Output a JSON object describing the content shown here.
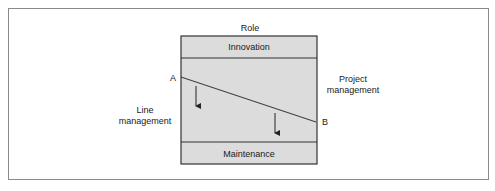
{
  "diagram": {
    "title": "Role",
    "top_band": "Innovation",
    "bottom_band": "Maintenance",
    "left_label": [
      "Line",
      "management"
    ],
    "right_label": [
      "Project",
      "management"
    ],
    "point_a": "A",
    "point_b": "B",
    "colors": {
      "box_fill": "#d9d9d9",
      "stroke": "#333333"
    }
  }
}
